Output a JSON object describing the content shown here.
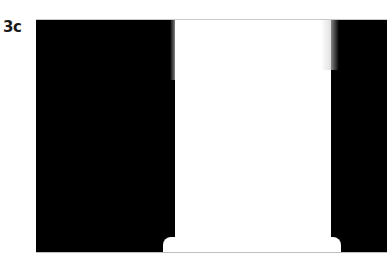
{
  "figure": {
    "panel_label": "3c",
    "colors": {
      "background": "#000000",
      "object": "#ffffff"
    }
  }
}
